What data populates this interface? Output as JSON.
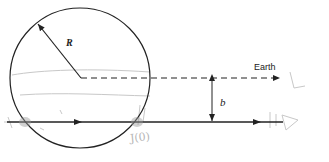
{
  "diagram": {
    "type": "impact-parameter geometry",
    "labels": {
      "radius": "R",
      "impact_parameter": "b",
      "observer": "Earth"
    },
    "scribbles": {
      "annotation_near_exit": "J(0)"
    },
    "colors": {
      "ink": "#222222",
      "pencil": "#b5b5b5"
    }
  }
}
